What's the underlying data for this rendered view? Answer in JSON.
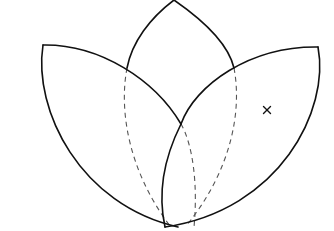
{
  "diagram": {
    "colors": {
      "background": "#ffffff",
      "solid_line": "#111111",
      "dashed_line": "#555555"
    },
    "petals": [
      {
        "name": "left-petal",
        "corner": [
          43,
          45
        ],
        "bottom_tip": [
          178,
          227
        ]
      },
      {
        "name": "center-petal",
        "apex": [
          174,
          0
        ],
        "bottom_tip": [
          178,
          227
        ]
      },
      {
        "name": "right-petal",
        "corner": [
          318,
          47
        ],
        "bottom_tip": [
          165,
          227
        ]
      }
    ],
    "marker": {
      "label": "×",
      "position": [
        267,
        110
      ]
    }
  }
}
